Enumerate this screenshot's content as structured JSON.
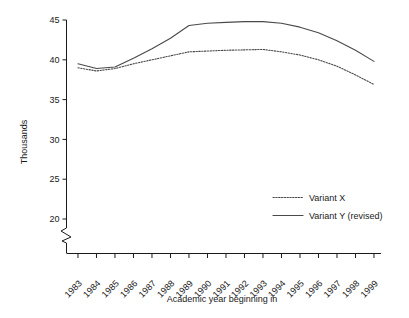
{
  "chart_data": {
    "type": "line",
    "title": "",
    "xlabel": "Academic year beginning in",
    "ylabel": "Thousands",
    "categories": [
      "1983",
      "1984",
      "1985",
      "1986",
      "1987",
      "1988",
      "1989",
      "1990",
      "1991",
      "1992",
      "1993",
      "1994",
      "1995",
      "1996",
      "1997",
      "1998",
      "1999"
    ],
    "x": [
      1983,
      1984,
      1985,
      1986,
      1987,
      1988,
      1989,
      1990,
      1991,
      1992,
      1993,
      1994,
      1995,
      1996,
      1997,
      1998,
      1999
    ],
    "series": [
      {
        "name": "Variant X",
        "style": "dotted",
        "values": [
          39.0,
          38.6,
          38.9,
          39.5,
          40.0,
          40.5,
          41.0,
          41.1,
          41.2,
          41.25,
          41.3,
          41.0,
          40.6,
          40.0,
          39.2,
          38.1,
          36.9
        ]
      },
      {
        "name": "Variant Y (revised)",
        "style": "solid",
        "values": [
          39.5,
          38.9,
          39.1,
          40.2,
          41.4,
          42.7,
          44.3,
          44.6,
          44.7,
          44.8,
          44.8,
          44.6,
          44.1,
          43.4,
          42.4,
          41.2,
          39.8
        ]
      }
    ],
    "ylim": [
      20,
      45
    ],
    "yticks": [
      20,
      25,
      30,
      35,
      40,
      45
    ],
    "ytick_labels": [
      "20",
      "25",
      "30",
      "35",
      "40",
      "45"
    ],
    "axis_break": true,
    "grid": false,
    "legend_position": "inside-right-lower",
    "colors": {
      "line": "#4a4a4a",
      "axis": "#1a1a1a",
      "background": "#ffffff"
    }
  },
  "legend": {
    "items": [
      {
        "label": "Variant X",
        "style": "dotted"
      },
      {
        "label": "Variant Y (revised)",
        "style": "solid"
      }
    ]
  }
}
